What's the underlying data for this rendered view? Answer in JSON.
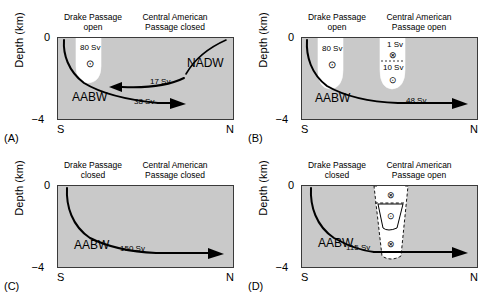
{
  "figure": {
    "axis": {
      "ylabel": "Depth (km)",
      "yticks": [
        "0",
        "−4"
      ],
      "xticks": [
        "S",
        "N"
      ]
    },
    "symbols": {
      "out_of_page": "⊙",
      "into_page": "⊗"
    },
    "panels": [
      {
        "letter": "(A)",
        "headers": {
          "left": "Drake Passage\nopen",
          "left_line1": "Drake Passage",
          "left_line2": "open",
          "right_line1": "Central American",
          "right_line2": "Passage closed"
        },
        "lobes": [
          {
            "name": "drake-passage-lobe",
            "value": "80 Sv",
            "symbol": "⊙"
          }
        ],
        "water_masses": [
          {
            "name": "AABW",
            "label": "AABW"
          },
          {
            "name": "NADW",
            "label": "NADW"
          }
        ],
        "flows": [
          {
            "name": "nadw-southward-flow",
            "value": "17 Sv",
            "direction": "west"
          },
          {
            "name": "aabw-northward-flow",
            "value": "38 Sv",
            "direction": "east"
          }
        ]
      },
      {
        "letter": "(B)",
        "headers": {
          "left_line1": "Drake Passage",
          "left_line2": "open",
          "right_line1": "Central American",
          "right_line2": "Passage open"
        },
        "lobes": [
          {
            "name": "drake-passage-lobe",
            "value": "80 Sv",
            "symbol": "⊙"
          },
          {
            "name": "central-american-lobe-upper",
            "value": "1 Sv",
            "symbol": "⊗"
          },
          {
            "name": "central-american-lobe-lower",
            "value": "10 Sv",
            "symbol": "⊙"
          }
        ],
        "water_masses": [
          {
            "name": "AABW",
            "label": "AABW"
          }
        ],
        "flows": [
          {
            "name": "aabw-northward-flow",
            "value": "48 Sv",
            "direction": "east"
          }
        ]
      },
      {
        "letter": "(C)",
        "headers": {
          "left_line1": "Drake Passage",
          "left_line2": "closed",
          "right_line1": "Central American",
          "right_line2": "Passage closed"
        },
        "lobes": [],
        "water_masses": [
          {
            "name": "AABW",
            "label": "AABW"
          }
        ],
        "flows": [
          {
            "name": "aabw-northward-flow",
            "value": "150 Sv",
            "direction": "east"
          }
        ]
      },
      {
        "letter": "(D)",
        "headers": {
          "left_line1": "Drake Passage",
          "left_line2": "closed",
          "right_line1": "Central American",
          "right_line2": "Passage open"
        },
        "lobes": [
          {
            "name": "central-american-cell-top",
            "value": "",
            "symbol": "⊗"
          },
          {
            "name": "central-american-cell-middle",
            "value": "",
            "symbol": "⊙"
          },
          {
            "name": "central-american-cell-bottom",
            "value": "",
            "symbol": "⊗"
          }
        ],
        "water_masses": [
          {
            "name": "AABW",
            "label": "AABW"
          }
        ],
        "flows": [
          {
            "name": "aabw-northward-flow",
            "value": "115 Sv",
            "direction": "east"
          }
        ]
      }
    ],
    "colors": {
      "plot_background": "#c9c9c9",
      "lobe_fill": "#ffffff",
      "line": "#000000",
      "axis": "#3a3a3a"
    }
  }
}
